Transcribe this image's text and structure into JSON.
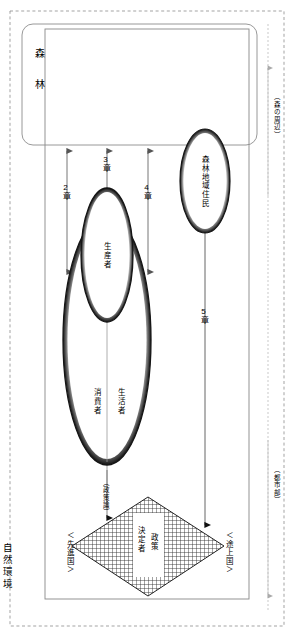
{
  "figure": {
    "title_label": "自然環境",
    "type": "diagram",
    "orientation": "rotated-90"
  },
  "regions": {
    "outer_boundary_label": "自然環境",
    "forest_box_label": "森 林",
    "periphery_label": "（森の周辺）",
    "urban_label": "（都市部）"
  },
  "actors": [
    {
      "id": "forest-residents",
      "label": "森林地域住民"
    },
    {
      "id": "producer",
      "label": "生産者"
    },
    {
      "id": "inhabitant",
      "label": "生活者"
    },
    {
      "id": "consumer",
      "label": "消費者"
    },
    {
      "id": "policy-maker",
      "label_line1": "政策",
      "label_line2": "決定者"
    }
  ],
  "chapters": [
    {
      "id": "ch2",
      "label": "2章"
    },
    {
      "id": "ch3",
      "label": "3章"
    },
    {
      "id": "ch4",
      "label": "4章"
    },
    {
      "id": "ch5",
      "label": "5章"
    }
  ],
  "annotations": {
    "policy_theory": "（政策論）",
    "developed_countries": "＜先進国＞",
    "developing_countries": "＜途上国＞"
  },
  "colors": {
    "line": "#000000",
    "thin_line": "#808080",
    "dashed": "#999999",
    "background": "#ffffff",
    "hatch": "#333333"
  }
}
